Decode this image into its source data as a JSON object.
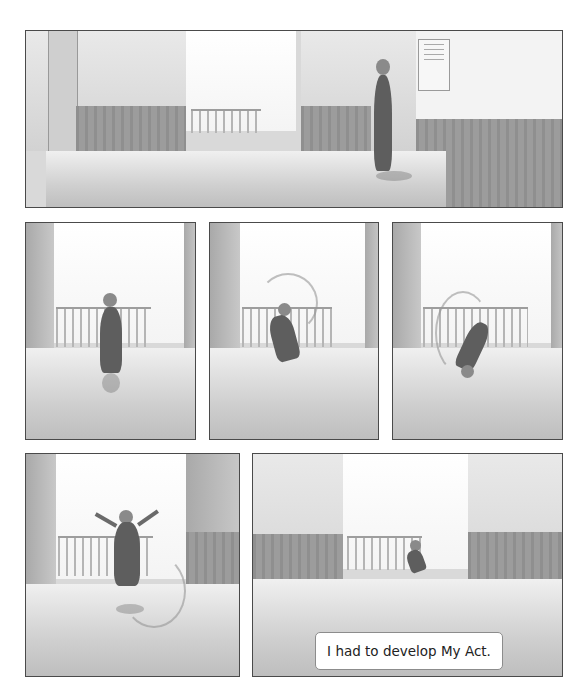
{
  "page": {
    "background": "#ffffff",
    "border_color": "#4a4a4a"
  },
  "panels": [
    {
      "id": 1,
      "scene": "Long school hallway; boy standing at right looking at a framed notice on the wall",
      "bounds": [
        25,
        30,
        563,
        208
      ]
    },
    {
      "id": 2,
      "scene": "Boy walking toward window and railing, seen from behind",
      "bounds": [
        25,
        222,
        196,
        440
      ]
    },
    {
      "id": 3,
      "scene": "Boy beginning a cartwheel with motion arc",
      "bounds": [
        209,
        222,
        379,
        440
      ]
    },
    {
      "id": 4,
      "scene": "Boy upside down mid-cartwheel with motion arc",
      "bounds": [
        392,
        222,
        563,
        440
      ]
    },
    {
      "id": 5,
      "scene": "Boy leaping with arms raised, motion lines below",
      "bounds": [
        25,
        453,
        240,
        677
      ]
    },
    {
      "id": 6,
      "scene": "Boy leaping across the hallway in the distance",
      "bounds": [
        252,
        453,
        563,
        677
      ]
    }
  ],
  "caption": {
    "text": "I had to develop My Act."
  }
}
